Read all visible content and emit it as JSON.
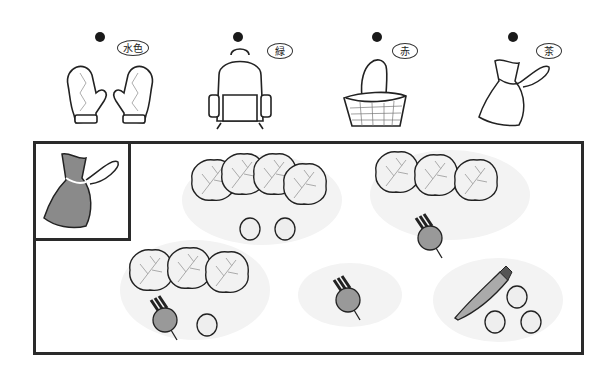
{
  "choices": [
    {
      "item": "mittens",
      "color_label": "水色"
    },
    {
      "item": "backpack",
      "color_label": "緑"
    },
    {
      "item": "basket",
      "color_label": "赤"
    },
    {
      "item": "drawstring-bag",
      "color_label": "茶"
    }
  ],
  "sample": {
    "item": "drawstring-bag",
    "fill": "#8a8a8a"
  },
  "groups": [
    {
      "cabbages": 4,
      "turnips": 0,
      "potatoes": 2,
      "carrots": 0
    },
    {
      "cabbages": 3,
      "turnips": 1,
      "potatoes": 0,
      "carrots": 0
    },
    {
      "cabbages": 3,
      "turnips": 1,
      "potatoes": 1,
      "carrots": 0
    },
    {
      "cabbages": 0,
      "turnips": 1,
      "potatoes": 0,
      "carrots": 0
    },
    {
      "cabbages": 0,
      "turnips": 0,
      "potatoes": 3,
      "carrots": 1
    }
  ]
}
